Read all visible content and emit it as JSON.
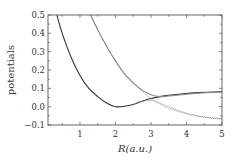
{
  "chart_data": {
    "type": "line",
    "title": "",
    "xlabel": "R(a.u.)",
    "ylabel": "potentials",
    "xlim": [
      0.1,
      5
    ],
    "ylim": [
      -0.1,
      0.5
    ],
    "xticks": [
      1,
      2,
      3,
      4,
      5
    ],
    "xtick_labels": [
      "1",
      "2",
      "3",
      "4",
      "5"
    ],
    "yticks": [
      -0.1,
      0.0,
      0.1,
      0.2,
      0.3,
      0.4,
      0.5
    ],
    "ytick_labels": [
      "−0.1",
      "0.0",
      "0.1",
      "0.2",
      "0.3",
      "0.4",
      "0.5"
    ],
    "grid": false,
    "legend": "none",
    "series": [
      {
        "name": "lower state (solid)",
        "style": "solid",
        "color": "#333333",
        "x": [
          0.35,
          0.5,
          0.75,
          1.0,
          1.25,
          1.5,
          1.75,
          2.0,
          2.25,
          2.5,
          2.75,
          3.0,
          3.25,
          3.5,
          4.0,
          4.5,
          5.0
        ],
        "y": [
          0.5,
          0.4,
          0.27,
          0.17,
          0.1,
          0.055,
          0.02,
          0.0,
          0.002,
          0.012,
          0.03,
          0.045,
          0.055,
          0.062,
          0.072,
          0.078,
          0.082
        ]
      },
      {
        "name": "upper state (solid)",
        "style": "solid",
        "color": "#888888",
        "x": [
          1.3,
          1.5,
          1.75,
          2.0,
          2.25,
          2.5,
          2.75,
          3.0,
          3.25,
          3.5,
          4.0,
          4.5,
          5.0
        ],
        "y": [
          0.5,
          0.42,
          0.33,
          0.25,
          0.18,
          0.13,
          0.09,
          0.065,
          0.055,
          0.058,
          0.068,
          0.076,
          0.08
        ],
        "note": "avoided crossing near R=3"
      },
      {
        "name": "diabatic repulsive (dotted)",
        "style": "dotted",
        "color": "#888888",
        "x": [
          1.3,
          1.5,
          1.75,
          2.0,
          2.25,
          2.5,
          2.75,
          3.0,
          3.25,
          3.5,
          4.0,
          4.5,
          5.0
        ],
        "y": [
          0.5,
          0.42,
          0.33,
          0.25,
          0.18,
          0.13,
          0.085,
          0.045,
          0.015,
          -0.008,
          -0.04,
          -0.058,
          -0.068
        ]
      },
      {
        "name": "lower adiabatic after crossing (dotted)",
        "style": "dotted",
        "color": "#888888",
        "x": [
          2.5,
          2.75,
          3.0,
          3.25,
          3.5,
          4.0,
          4.5,
          5.0
        ],
        "y": [
          0.012,
          0.028,
          0.035,
          0.02,
          0.0,
          -0.035,
          -0.055,
          -0.065
        ]
      }
    ]
  }
}
